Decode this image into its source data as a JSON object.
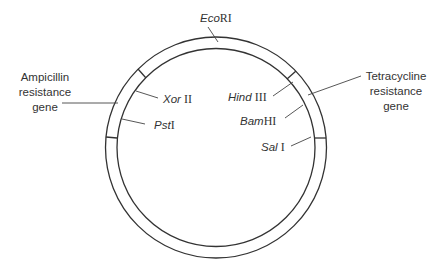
{
  "figure": {
    "type": "plasmid-map",
    "colors": {
      "stroke": "#333333",
      "text": "#333333",
      "background": "#ffffff"
    },
    "circle": {
      "cx": 216,
      "cy": 147.5,
      "outer_r": 110.5,
      "inner_r": 99
    },
    "restriction_sites": [
      {
        "id": "ecori",
        "italic": "Eco",
        "roman": "RI"
      },
      {
        "id": "xorii",
        "italic": "Xor",
        "roman": " II"
      },
      {
        "id": "psti",
        "italic": "Pst",
        "roman": "I"
      },
      {
        "id": "hindiii",
        "italic": "Hind",
        "roman": " III"
      },
      {
        "id": "bamhi",
        "italic": "Bam",
        "roman": "HI"
      },
      {
        "id": "sali",
        "italic": "Sal",
        "roman": " I"
      }
    ],
    "genes": [
      {
        "id": "ampicillin",
        "lines": [
          "Ampicillin",
          "resistance",
          "gene"
        ]
      },
      {
        "id": "tetracycline",
        "lines": [
          "Tetracycline",
          "resistance",
          "gene"
        ]
      }
    ]
  }
}
